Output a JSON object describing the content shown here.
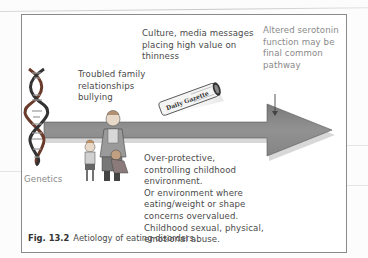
{
  "figure": {
    "number": "Fig. 13.2",
    "caption": "Aetiology of eating disorders.",
    "labels": {
      "genetics": "Genetics",
      "family": "Troubled family\nrelationships\nbullying",
      "culture": "Culture, media messages\nplacing high value on\nthinness",
      "serotonin": "Altered serotonin\nfunction may be\nfinal common\npathway",
      "environment": "Over-protective,\ncontrolling childhood\nenvironment.\nOr environment where\neating/weight or shape\nconcerns overvalued.\nChildhood sexual, physical,\nemotional abuse."
    },
    "newspaper_title": "Daily Gazette",
    "colors": {
      "arrow_fill": "#8c8c8c",
      "arrow_stroke": "#5a5a5a",
      "box_border": "#8a8a8a",
      "text": "#4a4a4a"
    }
  }
}
